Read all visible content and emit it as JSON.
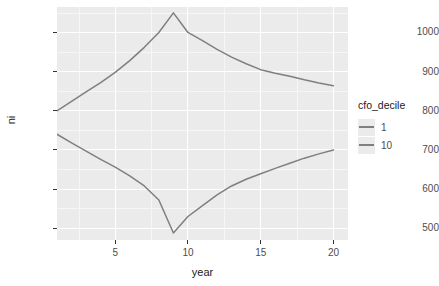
{
  "chart_data": {
    "type": "line",
    "title": "",
    "xlabel": "year",
    "ylabel": "ni",
    "xlim": [
      1,
      21
    ],
    "ylim": [
      470,
      1065
    ],
    "grid": true,
    "legend_position": "right",
    "legend_title": "cfo_decile",
    "x": [
      1,
      2,
      3,
      4,
      5,
      6,
      7,
      8,
      9,
      10,
      11,
      12,
      13,
      14,
      15,
      16,
      17,
      18,
      19,
      20
    ],
    "series": [
      {
        "name": "1",
        "color": "#7f7f7f",
        "values": [
          800,
          824,
          848,
          872,
          898,
          928,
          962,
          1000,
          1050,
          1000,
          979,
          957,
          937,
          920,
          905,
          896,
          888,
          879,
          871,
          864
        ]
      },
      {
        "name": "10",
        "color": "#7f7f7f",
        "values": [
          740,
          718,
          697,
          676,
          656,
          634,
          608,
          572,
          488,
          530,
          558,
          585,
          608,
          625,
          639,
          653,
          666,
          679,
          690,
          700
        ]
      }
    ],
    "x_ticks": [
      5,
      10,
      15,
      20
    ],
    "y_ticks": [
      500,
      600,
      700,
      800,
      900,
      1000
    ],
    "x_minor_ticks": [
      2.5,
      7.5,
      12.5,
      17.5
    ],
    "y_minor_ticks": [
      550,
      650,
      750,
      850,
      950,
      1050
    ],
    "panel_color": "#ebebeb",
    "gridline_color": "#ffffff"
  },
  "legend": {
    "title": "cfo_decile",
    "entries": [
      {
        "label": "1"
      },
      {
        "label": "10"
      }
    ]
  },
  "axes": {
    "x_title": "year",
    "y_title": "ni",
    "x_tick_labels": [
      "5",
      "10",
      "15",
      "20"
    ],
    "y_tick_labels": [
      "500",
      "600",
      "700",
      "800",
      "900",
      "1000"
    ]
  }
}
